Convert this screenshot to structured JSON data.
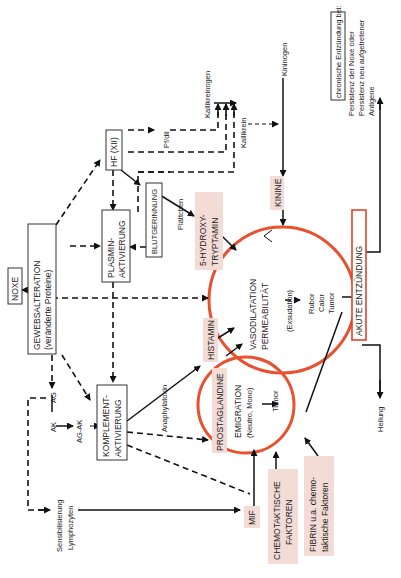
{
  "diagram": {
    "orientation": "rotated-90-ccw",
    "nodes": {
      "noxe": "NOXE",
      "gewebsalteration_1": "GEWEBSALTERATION",
      "gewebsalteration_2": "(veränderte Proteine)",
      "plasmin_1": "PLASMIN-",
      "plasmin_2": "AKTIVIERUNG",
      "hf": "HF (XII)",
      "blutgerinnung": "BLUTGERINNUNG",
      "komplement_1": "KOMPLEMENT-",
      "komplement_2": "AKTIVIERUNG",
      "ag": "AG",
      "ak": "AK",
      "ag_ak": "AG-AK",
      "pf_dil": "Pf/dil",
      "kallikreinogen": "Kallikreinogen",
      "kallikrein": "Kallikrein",
      "kininogen": "Kininogen",
      "kinine": "KININE",
      "plaettchen": "Plättchen",
      "hydroxy_1": "5-HYDROXY-",
      "hydroxy_2": "TRYPTAMIN",
      "histamin": "HISTAMIN",
      "prostaglandine": "PROSTAGLANDINE",
      "anaphylatoxin": "Anaphylatoxin",
      "vaso_1": "VASODILATATION",
      "vaso_2": "PERMEABILITÄT",
      "vaso_3": "(Exsudation)",
      "rubor": "Rubor",
      "calor": "Calor",
      "tumor": "Tumor",
      "emig_1": "EMIGRATION",
      "emig_2": "(Neutro, Mono)",
      "emig_tumor": "Tumor",
      "akute": "AKUTE ENTZÜNDUNG",
      "chronisch_title": "chronische Entzündung bei:",
      "chronisch_1": "Persistenz der Noxe oder",
      "chronisch_2": "Persistenz neu aufgetretener",
      "chronisch_3": "Antigene",
      "heilung": "Heilung",
      "mif": "MIF",
      "chemo_1": "CHEMOTAKTISCHE",
      "chemo_2": "FAKTOREN",
      "fibrin_1": "FIBRIN u.a. chemo-",
      "fibrin_2": "taktische Faktoren",
      "sens_1": "Sensibilisierung",
      "sens_2": "Lymphozyten"
    },
    "colors": {
      "circle": "#e8512f",
      "highlight": "#f3dcd6",
      "line": "#111111"
    }
  }
}
